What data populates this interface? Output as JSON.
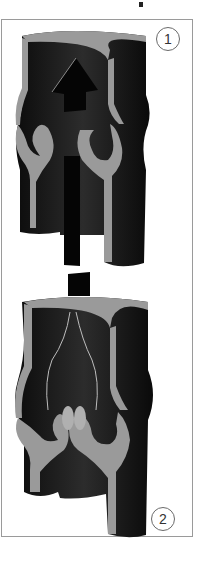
{
  "figure": {
    "panels": [
      {
        "label": "1",
        "state": "open",
        "description": "Valve cusps open, blood flows upward (arrow)"
      },
      {
        "label": "2",
        "state": "closed",
        "description": "Valve cusps closed, backflow blocked"
      }
    ]
  },
  "colors": {
    "vessel_dark": "#1a1a1a",
    "vessel_wall": "#9a9a9a",
    "frame": "#9a9a9a",
    "background": "#ffffff"
  }
}
